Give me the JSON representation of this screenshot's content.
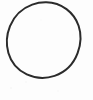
{
  "image": {
    "kind": "scanned-drawing",
    "subject": "hand-drawn circle outline",
    "width": 93,
    "height": 100,
    "background_color": "#fdfdfd",
    "page_color": "#ffffff",
    "has_text": false,
    "caption": ""
  },
  "shape": {
    "name": "circle",
    "style": "hand-drawn outline, unfilled",
    "stroke_color": "#2b2b2b",
    "stroke_width": 2,
    "fill": "none",
    "center_x": 46,
    "center_y": 40,
    "radius_x": 34,
    "radius_y": 38,
    "bounds": {
      "left": 12,
      "top": 2,
      "right": 80,
      "bottom": 78
    },
    "path": "M 46.3 2.2 C 61.5 2.4 74.2 12.6 78.6 25.8 C 81.6 34.6 80.9 44.4 77.6 53.2 C 73.6 63.8 65.2 72.3 54.6 75.9 C 45.6 78.9 35.4 78.4 26.8 74.4 C 18.0 70.3 11.1 62.4 8.4 53.0 C 5.9 44.3 6.6 34.6 10.0 26.2 C 13.9 16.4 22.0 8.3 32.2 4.6 C 36.7 2.9 41.5 2.1 46.3 2.2 Z"
  },
  "margins": {
    "right_blank_strip": true,
    "bottom_blank_strip": true
  }
}
